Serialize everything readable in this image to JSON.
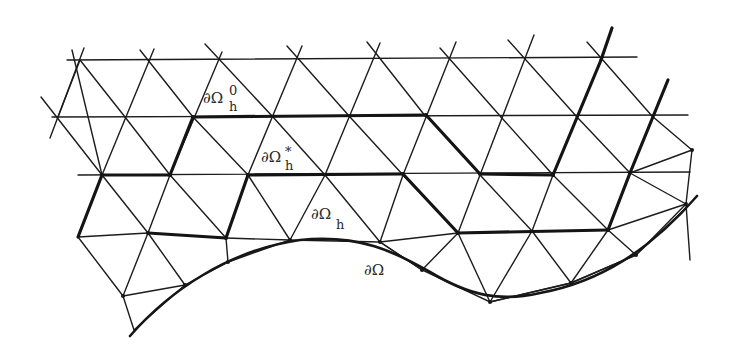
{
  "figure": {
    "colors": {
      "ink": "#1c1c1c",
      "background": "#ffffff"
    },
    "labels": {
      "boundary_h0": {
        "base": "∂Ω",
        "sub": "h",
        "sup": "0"
      },
      "boundary_hstar": {
        "base": "∂Ω",
        "sub": "h",
        "sup": "*"
      },
      "boundary_h": {
        "base": "∂Ω",
        "sub": "h",
        "sup": ""
      },
      "boundary_exact": {
        "base": "∂Ω",
        "sub": "",
        "sup": ""
      }
    }
  }
}
